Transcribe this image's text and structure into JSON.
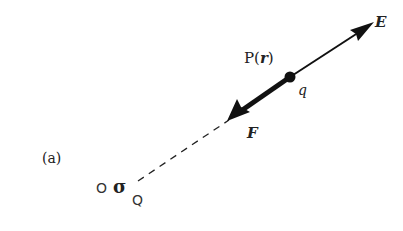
{
  "figure": {
    "panel_label": "(a)",
    "point_P": {
      "name": "P",
      "open": "(",
      "vector": "r",
      "close": ")"
    },
    "charge_q": "q",
    "field_label": "E",
    "force_label": "F",
    "origin_label": "O",
    "source_symbol": "σ",
    "source_label": "Q"
  },
  "colors": {
    "stroke": "#111111",
    "text": "#222222"
  }
}
